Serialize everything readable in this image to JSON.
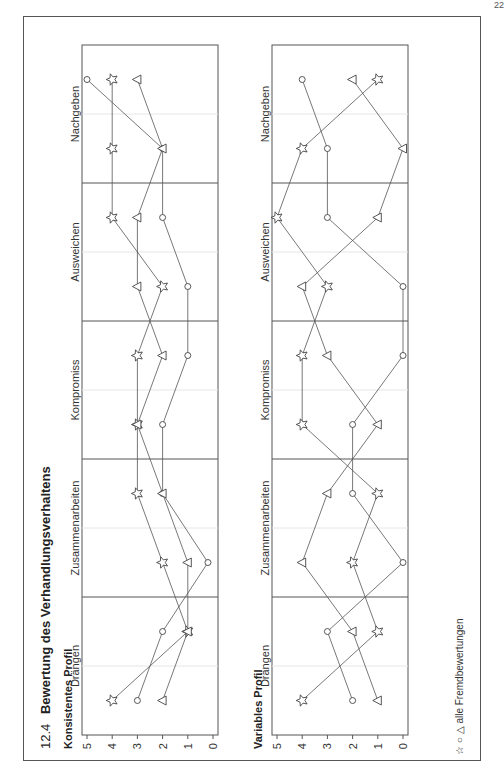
{
  "page_number": "22",
  "section": {
    "number": "12.4",
    "title": "Bewertung des Verhandlungsverhaltens"
  },
  "legend": {
    "symbols": [
      "☆",
      "○",
      "△"
    ],
    "label": "alle Fremdbewertungen"
  },
  "colors": {
    "line": "#555555",
    "marker_stroke": "#444444",
    "frame": "#555555",
    "grid": "#e6e6e6"
  },
  "chart_data": [
    {
      "type": "line",
      "title": "Konsistentes Profil",
      "categories": [
        "Drängen",
        "Zusammenarbeiten",
        "Kompromiss",
        "Ausweichen",
        "Nachgeben"
      ],
      "points_per_category": 2,
      "ylim": [
        0,
        5
      ],
      "yticks": [
        0,
        1,
        2,
        3,
        4,
        5
      ],
      "xlabel": "",
      "ylabel": "",
      "series": [
        {
          "name": "star",
          "marker": "star",
          "values": [
            4,
            1,
            2,
            3,
            3,
            3,
            2,
            4,
            4,
            4
          ]
        },
        {
          "name": "circle",
          "marker": "circle",
          "values": [
            3,
            2,
            0.2,
            2,
            2,
            1,
            1,
            2,
            2,
            5
          ]
        },
        {
          "name": "triangle",
          "marker": "triangle",
          "values": [
            2,
            1,
            1,
            2,
            3,
            2,
            3,
            3,
            2,
            3
          ]
        }
      ]
    },
    {
      "type": "line",
      "title": "Variables Profil",
      "categories": [
        "Drängen",
        "Zusammenarbeiten",
        "Kompromiss",
        "Ausweichen",
        "Nachgeben"
      ],
      "points_per_category": 2,
      "ylim": [
        0,
        5
      ],
      "yticks": [
        0,
        1,
        2,
        3,
        4,
        5
      ],
      "xlabel": "",
      "ylabel": "",
      "series": [
        {
          "name": "star",
          "marker": "star",
          "values": [
            4,
            1,
            2,
            1,
            4,
            4,
            3,
            5,
            4,
            1
          ]
        },
        {
          "name": "circle",
          "marker": "circle",
          "values": [
            2,
            3,
            0,
            2,
            2,
            0,
            0,
            3,
            3,
            4
          ]
        },
        {
          "name": "triangle",
          "marker": "triangle",
          "values": [
            1,
            2,
            4,
            3,
            1,
            3,
            4,
            1,
            0,
            2
          ]
        }
      ]
    }
  ]
}
